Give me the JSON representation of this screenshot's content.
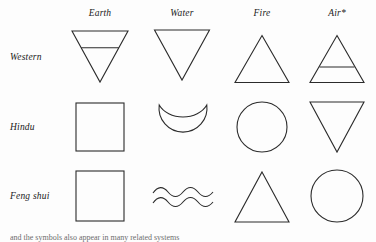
{
  "figure": {
    "stroke_color": "#2b2b2b",
    "background_color": "#fdfdfd"
  },
  "columns": [
    {
      "label": "Earth",
      "center_x": 100
    },
    {
      "label": "Water",
      "center_x": 182
    },
    {
      "label": "Fire",
      "center_x": 262
    },
    {
      "label": "Air*",
      "center_x": 337
    }
  ],
  "rows": [
    {
      "label": "Western",
      "center_y": 57
    },
    {
      "label": "Hindu",
      "center_y": 127
    },
    {
      "label": "Feng shui",
      "center_y": 196
    }
  ],
  "header_y": 14,
  "cells": {
    "western": {
      "earth": "inverted-triangle-with-bar",
      "water": "inverted-triangle",
      "fire": "triangle",
      "air": "triangle-with-bar"
    },
    "hindu": {
      "earth": "square",
      "water": "crescent",
      "fire": "circle",
      "air": "inverted-triangle"
    },
    "feng_shui": {
      "earth": "square",
      "water": "double-wave",
      "fire": "triangle",
      "air": "circle"
    }
  },
  "footnote": {
    "text": "and the symbols also appear in many related systems"
  }
}
